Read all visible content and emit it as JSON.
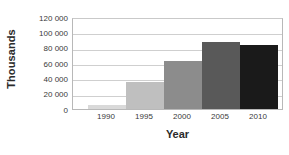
{
  "chart_data": {
    "type": "bar",
    "title": "",
    "xlabel": "Year",
    "ylabel": "Thousands",
    "categories": [
      "1990",
      "1995",
      "2000",
      "2005",
      "2010"
    ],
    "values": [
      5000,
      35000,
      62000,
      88000,
      84000
    ],
    "ylim": [
      0,
      120000
    ],
    "ytick_values": [
      0,
      20000,
      40000,
      60000,
      80000,
      100000,
      120000
    ],
    "ytick_labels": [
      "0",
      "20 000",
      "40 000",
      "60 000",
      "80 000",
      "100 000",
      "120 000"
    ],
    "grid": "horizontal",
    "legend": "none",
    "bar_colors": [
      "#d9d9d9",
      "#bfbfbf",
      "#8c8c8c",
      "#595959",
      "#1a1a1a"
    ]
  },
  "axes": {
    "y_title": "Thousands",
    "x_title": "Year"
  }
}
